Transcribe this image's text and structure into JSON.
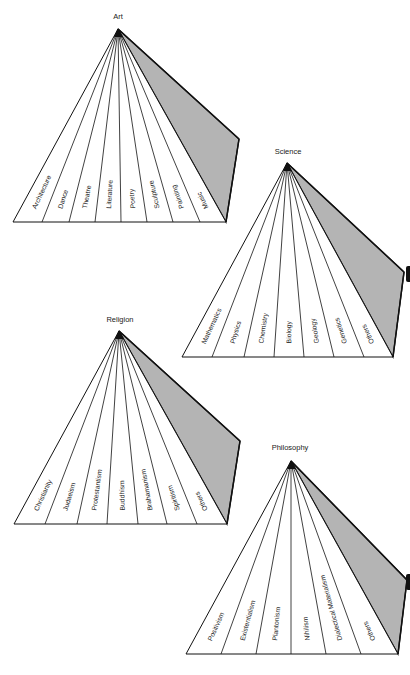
{
  "colors": {
    "background": "#ffffff",
    "line": "#111111",
    "shade": "#b4b4b4",
    "text": "#222222"
  },
  "pyramids": [
    {
      "id": "art",
      "title": "Art",
      "title_pos": [
        118,
        19
      ],
      "apex": [
        118,
        29
      ],
      "base_y": 222,
      "base_ticks": [
        13,
        42,
        69,
        95,
        121,
        147,
        173,
        200,
        226
      ],
      "side_corner": [
        239,
        139
      ],
      "labels": [
        "Architecture",
        "Dance",
        "Theatre",
        "Literature",
        "Poetry",
        "Sculpture",
        "Painting",
        "Music"
      ]
    },
    {
      "id": "science",
      "title": "Science",
      "title_pos": [
        288,
        154
      ],
      "apex": [
        287,
        163
      ],
      "base_y": 357,
      "base_ticks": [
        182,
        212,
        244,
        274,
        304,
        334,
        364,
        393
      ],
      "side_corner": [
        404,
        272
      ],
      "labels": [
        "Mathematics",
        "Physics",
        "Chemistry",
        "Biology",
        "Geology",
        "Genetics",
        "Others"
      ]
    },
    {
      "id": "religion",
      "title": "Religion",
      "title_pos": [
        120,
        322
      ],
      "apex": [
        119,
        331
      ],
      "base_y": 524,
      "base_ticks": [
        14,
        45,
        77,
        107,
        138,
        167,
        197,
        227
      ],
      "side_corner": [
        240,
        441
      ],
      "labels": [
        "Christianity",
        "Judaeism",
        "Protestantism",
        "Buddhism",
        "Brahamanism",
        "Spiritism",
        "Others"
      ]
    },
    {
      "id": "philosophy",
      "title": "Philosophy",
      "title_pos": [
        290,
        450
      ],
      "apex": [
        291,
        461
      ],
      "base_y": 654,
      "base_ticks": [
        186,
        221,
        256,
        291,
        326,
        361,
        398
      ],
      "side_corner": [
        407,
        580
      ],
      "labels": [
        "Positivism",
        "Existentialism",
        "Plantonism",
        "Nihilism",
        "Dialectical Materialism",
        "Others"
      ]
    }
  ]
}
